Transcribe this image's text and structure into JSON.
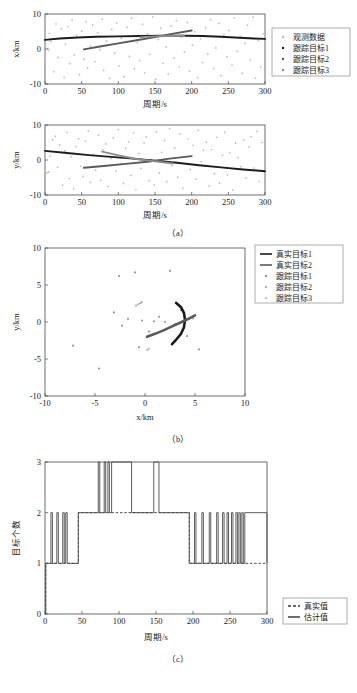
{
  "figure": {
    "title": "",
    "panels": [
      "a",
      "b",
      "c"
    ]
  },
  "captions": {
    "a": "（a）",
    "b": "（b）",
    "c": "（c）"
  },
  "chart_data": [
    {
      "id": "panel-a-top",
      "type": "scatter",
      "title": "",
      "xlabel": "周期/s",
      "ylabel": "x/km",
      "xlim": [
        0,
        300
      ],
      "ylim": [
        -10,
        10
      ],
      "xticks": [
        0,
        50,
        100,
        150,
        200,
        250,
        300
      ],
      "yticks": [
        -10,
        0,
        10
      ],
      "grid": false,
      "legend_position": "right-outside",
      "legend": [
        "观测数据",
        "跟踪目标1",
        "跟踪目标2",
        "跟踪目标3"
      ],
      "colors": {
        "观测数据": "#b9b9b9",
        "跟踪目标1": "#1c1c1c",
        "跟踪目标2": "#5a5a5a",
        "跟踪目标3": "#8c8c8c"
      },
      "series": [
        {
          "name": "跟踪目标1",
          "type": "line",
          "x": [
            0,
            20,
            45,
            70,
            100,
            130,
            160,
            190,
            215,
            240,
            265,
            285,
            300
          ],
          "y": [
            2.6,
            3.0,
            3.3,
            3.5,
            3.6,
            3.7,
            3.8,
            3.8,
            3.7,
            3.5,
            3.2,
            3.0,
            2.9
          ]
        },
        {
          "name": "跟踪目标2",
          "type": "line",
          "x": [
            53,
            75,
            100,
            125,
            150,
            175,
            200
          ],
          "y": [
            -0.1,
            0.7,
            1.6,
            2.5,
            3.4,
            4.4,
            5.3
          ]
        },
        {
          "name": "跟踪目标3",
          "type": "line",
          "x": [
            130,
            150,
            170,
            190
          ],
          "y": [
            3.4,
            3.6,
            3.7,
            3.8
          ]
        },
        {
          "name": "观测数据",
          "type": "scatter",
          "x": [
            4,
            5,
            6,
            8,
            12,
            15,
            18,
            22,
            26,
            28,
            31,
            34,
            37,
            40,
            43,
            47,
            50,
            53,
            56,
            58,
            62,
            65,
            68,
            72,
            75,
            78,
            80,
            84,
            88,
            91,
            95,
            98,
            101,
            104,
            108,
            112,
            115,
            118,
            122,
            126,
            129,
            133,
            136,
            140,
            143,
            147,
            151,
            154,
            158,
            161,
            165,
            168,
            172,
            176,
            179,
            183,
            186,
            190,
            194,
            197,
            201,
            204,
            208,
            212,
            215,
            219,
            222,
            226,
            230,
            233,
            237,
            240,
            244,
            248,
            251,
            255,
            258,
            262,
            266,
            269,
            273,
            276,
            280,
            284,
            287,
            291,
            294,
            298
          ],
          "y": [
            0.2,
            -0.3,
            4.5,
            2.1,
            -6.5,
            7.2,
            -2.4,
            5.8,
            -8.1,
            1.3,
            6.4,
            -4.2,
            8.3,
            -1.7,
            3.9,
            -7.3,
            5.1,
            -2.9,
            7.8,
            -5.4,
            0.8,
            6.9,
            -3.6,
            4.7,
            -0.2,
            8.6,
            -6.1,
            2.3,
            -8.4,
            5.6,
            -1.2,
            7.4,
            -4.8,
            3.1,
            -7.9,
            6.2,
            -2.1,
            8.8,
            -5.7,
            1.9,
            -3.3,
            7.1,
            -6.8,
            4.3,
            -1.5,
            9.2,
            -8.7,
            2.7,
            5.9,
            -4.1,
            0.6,
            -7.2,
            6.6,
            -2.6,
            8.1,
            -5.1,
            3.4,
            -0.9,
            7.6,
            -6.3,
            1.1,
            4.9,
            -8.2,
            2.9,
            -3.8,
            6.1,
            -1.4,
            8.4,
            -5.6,
            0.3,
            7.3,
            -7.6,
            4.1,
            -2.2,
            5.3,
            -4.6,
            8.9,
            -0.7,
            3.6,
            -6.9,
            1.6,
            6.8,
            -3.1,
            9.1,
            -8.3,
            2.4,
            -5.2,
            4.4
          ]
        }
      ]
    },
    {
      "id": "panel-a-bottom",
      "type": "scatter",
      "title": "",
      "xlabel": "周期/s",
      "ylabel": "y/km",
      "xlim": [
        0,
        300
      ],
      "ylim": [
        -10,
        10
      ],
      "xticks": [
        0,
        50,
        100,
        150,
        200,
        250,
        300
      ],
      "yticks": [
        -10,
        0,
        10
      ],
      "grid": false,
      "legend_position": "none",
      "legend": [],
      "colors": {
        "观测数据": "#b9b9b9",
        "跟踪目标1": "#1c1c1c",
        "跟踪目标2": "#5a5a5a",
        "跟踪目标3": "#8c8c8c"
      },
      "series": [
        {
          "name": "跟踪目标1",
          "type": "line",
          "x": [
            0,
            30,
            60,
            90,
            120,
            150,
            180,
            210,
            240,
            270,
            300
          ],
          "y": [
            2.6,
            2.0,
            1.4,
            0.9,
            0.4,
            -0.2,
            -0.8,
            -1.5,
            -2.1,
            -2.7,
            -3.2
          ]
        },
        {
          "name": "跟踪目标2",
          "type": "line",
          "x": [
            53,
            80,
            110,
            140,
            170,
            200
          ],
          "y": [
            -2.2,
            -1.7,
            -1.1,
            -0.5,
            0.4,
            1.1
          ]
        },
        {
          "name": "跟踪目标3",
          "type": "line",
          "x": [
            78,
            100,
            125,
            150,
            175
          ],
          "y": [
            2.4,
            1.3,
            0.3,
            -0.4,
            -1.0
          ]
        },
        {
          "name": "观测数据",
          "type": "scatter",
          "x": [
            3,
            5,
            7,
            10,
            14,
            17,
            20,
            24,
            27,
            30,
            33,
            36,
            39,
            42,
            46,
            49,
            52,
            55,
            59,
            62,
            66,
            69,
            73,
            76,
            79,
            83,
            86,
            90,
            93,
            97,
            100,
            103,
            107,
            110,
            114,
            117,
            121,
            124,
            128,
            131,
            135,
            138,
            142,
            145,
            149,
            152,
            156,
            159,
            163,
            166,
            170,
            173,
            177,
            181,
            184,
            188,
            191,
            195,
            198,
            202,
            206,
            209,
            213,
            216,
            220,
            224,
            227,
            231,
            234,
            238,
            242,
            245,
            249,
            252,
            256,
            260,
            263,
            267,
            271,
            274,
            278,
            281,
            285,
            289,
            292,
            296,
            299
          ],
          "y": [
            -3.6,
            -3.4,
            1.2,
            5.8,
            6.8,
            -2.1,
            4.3,
            -7.2,
            2.6,
            7.9,
            -5.3,
            0.9,
            -8.2,
            3.8,
            6.1,
            -1.8,
            -4.7,
            5.4,
            8.3,
            -6.4,
            1.5,
            -2.9,
            7.1,
            -5.8,
            2.9,
            4.6,
            -7.6,
            0.4,
            6.3,
            -3.2,
            8.7,
            -1.1,
            -6.7,
            3.3,
            5.2,
            -4.4,
            7.7,
            -8.5,
            1.8,
            -2.4,
            4.9,
            6.6,
            -5.9,
            0.2,
            -7.1,
            8.1,
            -3.7,
            2.2,
            5.6,
            -6.2,
            9.0,
            -1.6,
            3.5,
            -4.9,
            7.4,
            -8.1,
            1.0,
            6.0,
            -2.7,
            4.2,
            -5.5,
            8.5,
            -0.5,
            2.8,
            5.1,
            -7.4,
            3.0,
            -3.9,
            6.5,
            -6.6,
            1.4,
            7.9,
            -4.3,
            2.1,
            -8.6,
            4.8,
            0.7,
            -1.9,
            5.7,
            -5.1,
            3.7,
            6.7,
            -2.3,
            8.2,
            -6.1,
            5.0,
            -3.4
          ]
        }
      ]
    },
    {
      "id": "panel-b",
      "type": "scatter",
      "title": "",
      "xlabel": "x/km",
      "ylabel": "y/km",
      "xlim": [
        -10,
        10
      ],
      "ylim": [
        -10,
        10
      ],
      "xticks": [
        -10,
        -5,
        0,
        5,
        10
      ],
      "yticks": [
        -10,
        -5,
        0,
        5,
        10
      ],
      "grid": false,
      "legend_position": "right-outside",
      "legend": [
        "真实目标1",
        "真实目标2",
        "跟踪目标1",
        "跟踪目标2",
        "跟踪目标3"
      ],
      "colors": {
        "真实目标1": "#1c1c1c",
        "真实目标2": "#5a5a5a",
        "跟踪目标1": "#9a9a9a",
        "跟踪目标2": "#b0b0b0",
        "跟踪目标3": "#c2c2c2"
      },
      "series": [
        {
          "name": "真实目标1",
          "type": "line",
          "x": [
            3.1,
            3.6,
            3.9,
            4.0,
            3.9,
            3.6,
            3.1,
            2.7
          ],
          "y": [
            2.6,
            2.0,
            1.2,
            0.3,
            -0.7,
            -1.6,
            -2.4,
            -3.0
          ]
        },
        {
          "name": "真实目标2",
          "type": "line",
          "x": [
            0.2,
            1.0,
            1.9,
            2.7,
            3.5,
            4.3,
            5.0
          ],
          "y": [
            -2.0,
            -1.6,
            -1.1,
            -0.6,
            -0.1,
            0.4,
            0.9
          ]
        },
        {
          "name": "跟踪目标1",
          "type": "scatter",
          "x": [
            -7.2,
            -4.6,
            -3.1,
            -2.6,
            -2.3,
            -1.7,
            -1.0,
            -0.6,
            -0.3,
            0.4,
            0.9,
            1.4,
            2.0,
            2.5,
            3.0,
            3.6,
            4.2,
            4.8,
            5.4
          ],
          "y": [
            -3.2,
            -6.3,
            1.3,
            6.2,
            -0.5,
            0.4,
            6.7,
            -3.4,
            0.2,
            -1.3,
            0.1,
            0.7,
            0.0,
            6.9,
            -0.3,
            1.6,
            -1.9,
            0.5,
            -3.7
          ]
        },
        {
          "name": "跟踪目标2",
          "type": "scatter",
          "x": [
            -0.9,
            -0.7,
            -0.5,
            -0.4,
            -0.3
          ],
          "y": [
            2.2,
            2.4,
            2.5,
            2.6,
            2.7
          ]
        },
        {
          "name": "跟踪目标3",
          "type": "scatter",
          "x": [
            0.2,
            0.3,
            0.4
          ],
          "y": [
            -3.8,
            -3.7,
            -3.6
          ]
        }
      ]
    },
    {
      "id": "panel-c",
      "type": "line",
      "title": "",
      "xlabel": "周期/s",
      "ylabel": "目标个数",
      "xlim": [
        0,
        300
      ],
      "ylim": [
        0,
        3
      ],
      "xticks": [
        0,
        50,
        100,
        150,
        200,
        250,
        300
      ],
      "yticks": [
        0,
        1,
        2,
        3
      ],
      "grid": false,
      "legend_position": "bottom-right-outside",
      "legend": [
        "真实值",
        "估计值"
      ],
      "colors": {
        "真实值": "#3a3a3a",
        "估计值": "#4a4a4a"
      },
      "series": [
        {
          "name": "真实值",
          "type": "step",
          "style": "dashed",
          "x": [
            0,
            1,
            45,
            195,
            300
          ],
          "y": [
            0,
            1,
            2,
            1,
            1
          ]
        },
        {
          "name": "估计值",
          "type": "step",
          "style": "solid",
          "x": [
            0,
            1,
            8,
            10,
            16,
            18,
            24,
            26,
            28,
            30,
            45,
            72,
            74,
            80,
            82,
            85,
            87,
            90,
            115,
            117,
            145,
            147,
            152,
            154,
            195,
            202,
            204,
            212,
            214,
            222,
            224,
            232,
            234,
            240,
            242,
            246,
            248,
            252,
            254,
            258,
            260,
            262,
            264,
            266,
            268,
            270,
            300
          ],
          "y": [
            0,
            1,
            2,
            1,
            2,
            1,
            2,
            1,
            2,
            1,
            2,
            3,
            2,
            3,
            2,
            3,
            2,
            3,
            3,
            2,
            2,
            3,
            3,
            2,
            1,
            2,
            1,
            2,
            1,
            2,
            1,
            2,
            1,
            2,
            1,
            2,
            1,
            2,
            1,
            2,
            1,
            2,
            1,
            2,
            1,
            2,
            1
          ]
        }
      ]
    }
  ]
}
